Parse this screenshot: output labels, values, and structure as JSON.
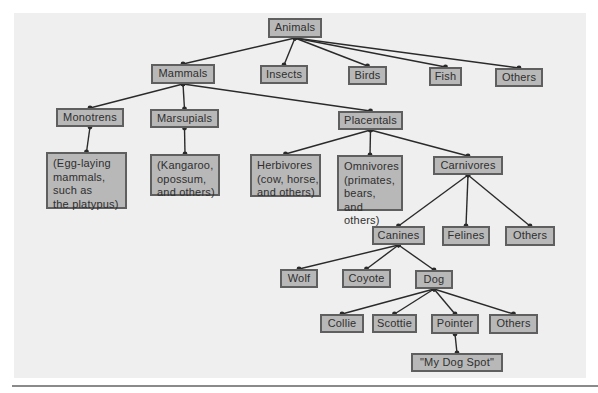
{
  "diagram": {
    "type": "tree",
    "colors": {
      "panel_background": "#efefef",
      "node_fill": "#b8b8b8",
      "node_border": "#5f5f5f",
      "edge": "#2a2a2a",
      "text": "#2f2f2f"
    },
    "nodes": [
      {
        "id": "animals",
        "label": "Animals",
        "parent": null,
        "box": [
          268,
          18,
          54,
          20
        ]
      },
      {
        "id": "mammals",
        "label": "Mammals",
        "parent": "animals",
        "box": [
          151,
          64,
          64,
          20
        ]
      },
      {
        "id": "insects",
        "label": "Insects",
        "parent": "animals",
        "box": [
          260,
          65,
          48,
          19
        ]
      },
      {
        "id": "birds",
        "label": "Birds",
        "parent": "animals",
        "box": [
          348,
          66,
          39,
          19
        ]
      },
      {
        "id": "fish",
        "label": "Fish",
        "parent": "animals",
        "box": [
          429,
          67,
          33,
          19
        ]
      },
      {
        "id": "animals-others",
        "label": "Others",
        "parent": "animals",
        "box": [
          495,
          68,
          48,
          19
        ]
      },
      {
        "id": "monotrens",
        "label": "Monotrens",
        "parent": "mammals",
        "box": [
          56,
          108,
          68,
          19
        ]
      },
      {
        "id": "marsupials",
        "label": "Marsupials",
        "parent": "mammals",
        "box": [
          150,
          109,
          69,
          19
        ]
      },
      {
        "id": "placentals",
        "label": "Placentals",
        "parent": "mammals",
        "box": [
          338,
          111,
          65,
          19
        ]
      },
      {
        "id": "egg-laying",
        "label": "(Egg-laying\nmammals,\nsuch as\nthe platypus)",
        "parent": "monotrens",
        "box": [
          46,
          152,
          81,
          57
        ],
        "multi": true
      },
      {
        "id": "kangaroo",
        "label": "(Kangaroo,\nopossum,\nand others)",
        "parent": "marsupials",
        "box": [
          150,
          154,
          70,
          42
        ],
        "multi": true
      },
      {
        "id": "herbivores",
        "label": "Herbivores\n(cow, horse,\nand others)",
        "parent": "placentals",
        "box": [
          250,
          154,
          71,
          43
        ],
        "multi": true
      },
      {
        "id": "omnivores",
        "label": "Omnivores\n(primates,\nbears,\nand others)",
        "parent": "placentals",
        "box": [
          337,
          155,
          66,
          56
        ],
        "multi": true
      },
      {
        "id": "carnivores",
        "label": "Carnivores",
        "parent": "placentals",
        "box": [
          433,
          156,
          70,
          19
        ]
      },
      {
        "id": "canines",
        "label": "Canines",
        "parent": "carnivores",
        "box": [
          372,
          226,
          53,
          19
        ]
      },
      {
        "id": "felines",
        "label": "Felines",
        "parent": "carnivores",
        "box": [
          442,
          226,
          48,
          20
        ]
      },
      {
        "id": "carnivores-others",
        "label": "Others",
        "parent": "carnivores",
        "box": [
          505,
          226,
          50,
          20
        ]
      },
      {
        "id": "wolf",
        "label": "Wolf",
        "parent": "canines",
        "box": [
          280,
          269,
          38,
          19
        ]
      },
      {
        "id": "coyote",
        "label": "Coyote",
        "parent": "canines",
        "box": [
          342,
          269,
          49,
          19
        ]
      },
      {
        "id": "dog",
        "label": "Dog",
        "parent": "canines",
        "box": [
          415,
          270,
          38,
          19
        ]
      },
      {
        "id": "collie",
        "label": "Collie",
        "parent": "dog",
        "box": [
          320,
          314,
          44,
          19
        ]
      },
      {
        "id": "scottie",
        "label": "Scottie",
        "parent": "dog",
        "box": [
          372,
          314,
          45,
          19
        ]
      },
      {
        "id": "pointer",
        "label": "Pointer",
        "parent": "dog",
        "box": [
          431,
          314,
          48,
          20
        ]
      },
      {
        "id": "dog-others",
        "label": "Others",
        "parent": "dog",
        "box": [
          489,
          314,
          49,
          20
        ]
      },
      {
        "id": "my-dog-spot",
        "label": "\"My Dog Spot\"",
        "parent": "pointer",
        "box": [
          411,
          353,
          92,
          19
        ]
      }
    ]
  }
}
